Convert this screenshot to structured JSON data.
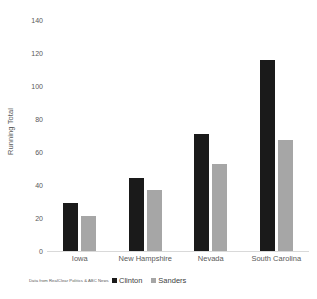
{
  "chart_data": {
    "type": "bar",
    "title": "",
    "xlabel": "",
    "ylabel": "Running Total",
    "ylim": [
      0,
      140
    ],
    "ytick_step": 20,
    "yticks": [
      140,
      120,
      100,
      80,
      60,
      40,
      20,
      0
    ],
    "grid": false,
    "legend_position": "bottom",
    "categories": [
      "Iowa",
      "New Hampshire",
      "Nevada",
      "South Carolina"
    ],
    "series": [
      {
        "name": "Clinton",
        "color": "#1a1a1a",
        "values": [
          29,
          44,
          71,
          116
        ]
      },
      {
        "name": "Sanders",
        "color": "#a6a6a6",
        "values": [
          21,
          37,
          53,
          67
        ]
      }
    ],
    "annotations": [
      "Data from RealClear Politics & ABC News"
    ]
  },
  "axis": {
    "y_title": "Running Total"
  },
  "legend": {
    "items": [
      {
        "label": "Clinton"
      },
      {
        "label": "Sanders"
      }
    ]
  },
  "footer": {
    "source_note": "Data from RealClear Politics & ABC News"
  }
}
